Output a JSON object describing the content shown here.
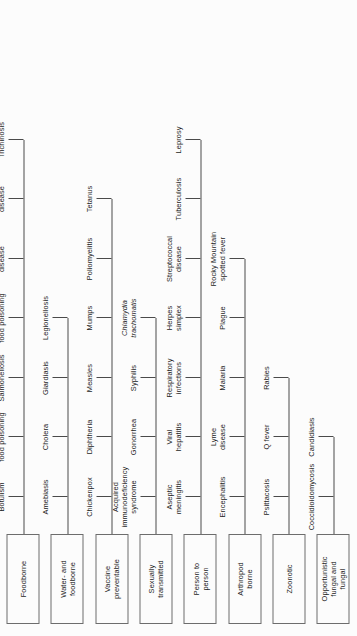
{
  "diagram": {
    "type": "hierarchy-bracket",
    "orientation": "rotated-90-ccw",
    "background_color": "#fcfcfc",
    "line_color": "#4a4a4a",
    "box_border_color": "#6d6d6d",
    "text_color": "#1c1c1c",
    "categories": [
      {
        "label": "Foodborne",
        "leaves": [
          "Botulism",
          "Clostridium perfringens food poisoning",
          "Salmonellosis",
          "Shigellosis food poisoning",
          "Staphylococcal disease",
          "Traveler's disease",
          "Trichinosis"
        ],
        "italic_leaves": [
          "Clostridium perfringens food poisoning"
        ]
      },
      {
        "label": "Water- and foodborne",
        "leaves": [
          "Amebiasis",
          "Cholera",
          "Giardiasis",
          "Legionellosis"
        ],
        "italic_leaves": []
      },
      {
        "label": "Vaccine preventable",
        "leaves": [
          "Chickenpox",
          "Diphtheria",
          "Measles",
          "Mumps",
          "Poliomyelitis",
          "Tetanus"
        ],
        "italic_leaves": []
      },
      {
        "label": "Sexually transmitted",
        "leaves": [
          "Acquired immunodeficiency syndrome",
          "Gonorrhea",
          "Syphilis",
          "Chlamydia trachomatis"
        ],
        "italic_leaves": [
          "Chlamydia trachomatis"
        ]
      },
      {
        "label": "Person to person",
        "leaves": [
          "Aseptic meningitis",
          "Viral hepatitis",
          "Respiratory infections",
          "Herpes simplex",
          "Streptococcal disease",
          "Tuberculosis",
          "Leprosy"
        ],
        "italic_leaves": []
      },
      {
        "label": "Arthropod borne",
        "leaves": [
          "Encephalitis",
          "Lyme disease",
          "Malaria",
          "Plague",
          "Rocky Mountain spotted fever"
        ],
        "italic_leaves": []
      },
      {
        "label": "Zoonotic",
        "leaves": [
          "Psittacosis",
          "Q fever",
          "Rabies"
        ],
        "italic_leaves": []
      },
      {
        "label": "Opportunistic fungal and fungal",
        "leaves": [
          "Coccidioidomycosis",
          "Candidiasis"
        ],
        "italic_leaves": []
      }
    ]
  }
}
